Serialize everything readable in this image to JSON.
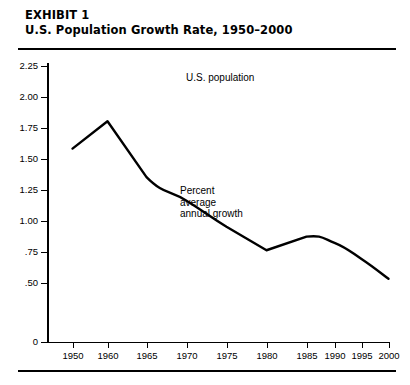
{
  "exhibit": {
    "label": "EXHIBIT 1",
    "title": "U.S. Population Growth Rate, 1950–2000"
  },
  "annotations": {
    "population": "U.S. population",
    "percent_line1": "Percent",
    "percent_line2": "average",
    "percent_line3": "annual growth"
  },
  "chart_data": {
    "type": "line",
    "title": "U.S. Population Growth Rate, 1950–2000",
    "xlabel": "",
    "ylabel": "",
    "grid": false,
    "legend": "none",
    "line_color": "#000000",
    "axis_color": "#000000",
    "ylim": [
      0,
      2.25
    ],
    "xlim": [
      1950,
      2000
    ],
    "y_ticks": [
      "2.25",
      "2.00",
      "1.75",
      "1.50",
      "1.25",
      "1.00",
      ".75",
      ".50",
      "0"
    ],
    "y_tick_values": [
      2.25,
      2.0,
      1.75,
      1.5,
      1.25,
      1.0,
      0.75,
      0.5,
      0
    ],
    "y_axis_note": "scale broken between .50 and 0",
    "x_ticks": [
      "1950",
      "1960",
      "1965",
      "1970",
      "1975",
      "1980",
      "1985",
      "1990",
      "1995",
      "2000"
    ],
    "x_tick_values": [
      1950,
      1960,
      1965,
      1970,
      1975,
      1980,
      1985,
      1990,
      1995,
      2000
    ],
    "x": [
      1950,
      1960,
      1965,
      1970,
      1975,
      1980,
      1985,
      1990,
      1995,
      2000
    ],
    "values": [
      1.58,
      1.8,
      1.35,
      1.16,
      0.95,
      0.76,
      0.87,
      0.82,
      0.69,
      0.53
    ],
    "series": [
      {
        "name": "Percent average annual growth",
        "values": [
          1.58,
          1.8,
          1.35,
          1.16,
          0.95,
          0.76,
          0.87,
          0.82,
          0.69,
          0.53
        ]
      }
    ],
    "annotations": [
      "U.S. population",
      "Percent average annual growth"
    ]
  }
}
